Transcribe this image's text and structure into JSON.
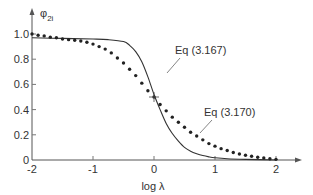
{
  "chart_data": {
    "type": "line",
    "title": "",
    "xlabel": "log λ",
    "ylabel": "φ",
    "ylabel_subscript": "2i",
    "xlim": [
      -2,
      2.3
    ],
    "ylim": [
      0,
      1.1
    ],
    "x_ticks": [
      -2,
      -1,
      0,
      1,
      2
    ],
    "x_tick_labels": [
      "-2",
      "-1",
      "0",
      "1",
      "2"
    ],
    "y_ticks": [
      0,
      0.2,
      0.4,
      0.6,
      0.8,
      1.0
    ],
    "y_tick_labels": [
      "0",
      "0.2",
      "0.4",
      "0.6",
      "0.8",
      "1.0"
    ],
    "grid": false,
    "legend": "none",
    "series": [
      {
        "name": "Eq (3.167)",
        "style": "solid",
        "x": [
          -2,
          -1.5,
          -1,
          -0.75,
          -0.5,
          -0.4,
          -0.3,
          -0.2,
          -0.1,
          0,
          0.1,
          0.2,
          0.3,
          0.4,
          0.5,
          0.6,
          0.7,
          0.8,
          0.9,
          1.0,
          1.2,
          1.5,
          2.0
        ],
        "y": [
          0.97,
          0.965,
          0.96,
          0.955,
          0.94,
          0.91,
          0.86,
          0.78,
          0.66,
          0.52,
          0.4,
          0.29,
          0.21,
          0.15,
          0.1,
          0.07,
          0.05,
          0.035,
          0.025,
          0.018,
          0.01,
          0.005,
          0.0
        ]
      },
      {
        "name": "Eq (3.170)",
        "style": "dotted",
        "x": [
          -2,
          -1.9,
          -1.8,
          -1.7,
          -1.6,
          -1.5,
          -1.4,
          -1.3,
          -1.2,
          -1.1,
          -1.0,
          -0.9,
          -0.8,
          -0.7,
          -0.6,
          -0.5,
          -0.4,
          -0.3,
          -0.2,
          -0.1,
          0,
          0.1,
          0.2,
          0.3,
          0.4,
          0.5,
          0.6,
          0.7,
          0.8,
          0.9,
          1.0,
          1.1,
          1.2,
          1.3,
          1.4,
          1.5,
          1.6,
          1.7,
          1.8,
          1.9,
          2.0
        ],
        "y": [
          1.0,
          0.99,
          0.985,
          0.975,
          0.97,
          0.96,
          0.955,
          0.95,
          0.945,
          0.935,
          0.92,
          0.9,
          0.88,
          0.85,
          0.81,
          0.77,
          0.72,
          0.67,
          0.61,
          0.55,
          0.5,
          0.44,
          0.39,
          0.34,
          0.3,
          0.26,
          0.22,
          0.19,
          0.16,
          0.13,
          0.11,
          0.09,
          0.075,
          0.06,
          0.048,
          0.038,
          0.03,
          0.022,
          0.016,
          0.01,
          0.005
        ]
      }
    ],
    "annotations": [
      {
        "text": "Eq (3.167)",
        "points_to_series": "Eq (3.167)",
        "at": [
          0.1,
          0.75
        ]
      },
      {
        "text": "Eq (3.170)",
        "points_to_series": "Eq (3.170)",
        "at": [
          0.9,
          0.26
        ]
      }
    ],
    "markers": [
      {
        "symbol": "+",
        "x": 0,
        "y": 0.5
      }
    ]
  }
}
